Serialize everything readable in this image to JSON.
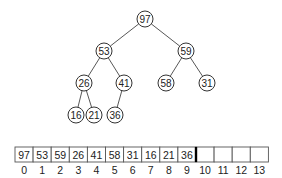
{
  "tree": {
    "nodes": [
      {
        "index": 0,
        "value": "97",
        "x": 145,
        "y": 19
      },
      {
        "index": 1,
        "value": "53",
        "x": 104,
        "y": 51
      },
      {
        "index": 2,
        "value": "59",
        "x": 186,
        "y": 51
      },
      {
        "index": 3,
        "value": "26",
        "x": 84,
        "y": 83
      },
      {
        "index": 4,
        "value": "41",
        "x": 124,
        "y": 83
      },
      {
        "index": 5,
        "value": "58",
        "x": 166,
        "y": 83
      },
      {
        "index": 6,
        "value": "31",
        "x": 207,
        "y": 83
      },
      {
        "index": 7,
        "value": "16",
        "x": 76,
        "y": 115
      },
      {
        "index": 8,
        "value": "21",
        "x": 94,
        "y": 115
      },
      {
        "index": 9,
        "value": "36",
        "x": 115,
        "y": 115
      }
    ],
    "edges": [
      [
        0,
        1
      ],
      [
        0,
        2
      ],
      [
        1,
        3
      ],
      [
        1,
        4
      ],
      [
        2,
        5
      ],
      [
        2,
        6
      ],
      [
        3,
        7
      ],
      [
        3,
        8
      ],
      [
        4,
        9
      ]
    ]
  },
  "array": {
    "cells": [
      "97",
      "53",
      "59",
      "26",
      "41",
      "58",
      "31",
      "16",
      "21",
      "36",
      "",
      "",
      "",
      ""
    ],
    "indices": [
      "0",
      "1",
      "2",
      "3",
      "4",
      "5",
      "6",
      "7",
      "8",
      "9",
      "10",
      "11",
      "12",
      "13"
    ],
    "heap_size": 10
  }
}
